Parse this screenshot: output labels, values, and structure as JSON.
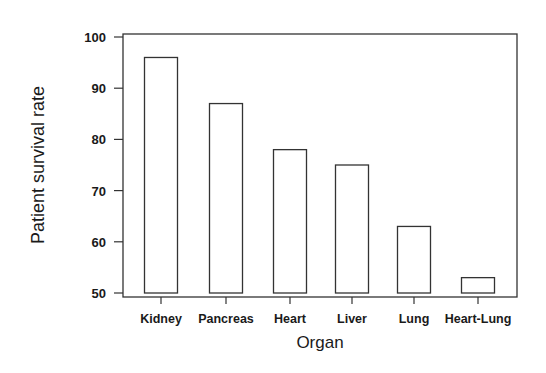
{
  "chart_data": {
    "type": "bar",
    "title": "",
    "xlabel": "Organ",
    "ylabel": "Patient survival rate",
    "categories": [
      "Kidney",
      "Pancreas",
      "Heart",
      "Liver",
      "Lung",
      "Heart-Lung"
    ],
    "values": [
      96,
      87,
      78,
      75,
      63,
      53
    ],
    "ylim": [
      50,
      100
    ],
    "yticks": [
      50,
      60,
      70,
      80,
      90,
      100
    ],
    "grid": false,
    "legend": null,
    "bar_fill": "#ffffff",
    "bar_stroke": "#333333"
  }
}
